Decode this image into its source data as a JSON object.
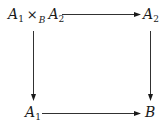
{
  "diagram": {
    "type": "commutative-square",
    "nodes": {
      "top_left": {
        "base": "A",
        "sub1": "1",
        "op": "×",
        "op_sub": "B",
        "base2": "A",
        "sub2": "2",
        "full_text": "A1 ×B A2"
      },
      "top_right": {
        "base": "A",
        "sub": "2",
        "full_text": "A2"
      },
      "bottom_left": {
        "base": "A",
        "sub": "1",
        "full_text": "A1"
      },
      "bottom_right": {
        "base": "B",
        "full_text": "B"
      }
    },
    "arrows": [
      {
        "from": "top_left",
        "to": "top_right",
        "direction": "right"
      },
      {
        "from": "top_left",
        "to": "bottom_left",
        "direction": "down"
      },
      {
        "from": "top_right",
        "to": "bottom_right",
        "direction": "down"
      },
      {
        "from": "bottom_left",
        "to": "bottom_right",
        "direction": "right"
      }
    ],
    "colors": {
      "ink": "#1a1a1a",
      "background": "#ffffff"
    }
  }
}
